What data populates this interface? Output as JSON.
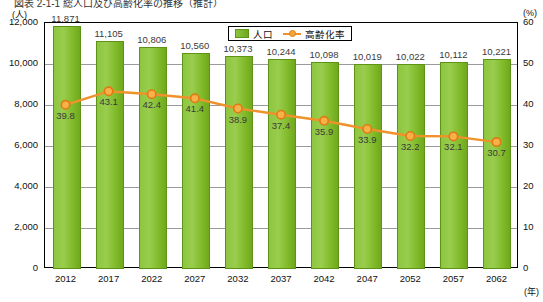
{
  "top_title": "図表 2-1-1 総人口及び高齢化率の推移（推計）",
  "legend": {
    "position": "top-center",
    "items": [
      {
        "name": "population-legend",
        "label": "人口",
        "color": "#8cc63f",
        "type": "bar"
      },
      {
        "name": "aging-rate-legend",
        "label": "高齢化率",
        "color": "#f0922b",
        "type": "line"
      }
    ]
  },
  "axes": {
    "y_left_unit": "(人)",
    "y_right_unit": "(%)",
    "x_unit": "(年)",
    "y_left_ticks": [
      "0",
      "2,000",
      "4,000",
      "6,000",
      "8,000",
      "10,000",
      "12,000"
    ],
    "y_right_ticks": [
      "0",
      "10",
      "20",
      "30",
      "40",
      "50",
      "60"
    ]
  },
  "chart_data": {
    "type": "bar",
    "title": "図表 2-1-1 総人口及び高齢化率の推移（推計）",
    "xlabel": "(年)",
    "ylabel": "(人)",
    "y2label": "(%)",
    "ylim": [
      0,
      12000
    ],
    "y2lim": [
      0,
      60
    ],
    "grid": true,
    "categories": [
      "2012",
      "2017",
      "2022",
      "2027",
      "2032",
      "2037",
      "2042",
      "2047",
      "2052",
      "2057",
      "2062"
    ],
    "series": [
      {
        "name": "人口",
        "type": "bar",
        "axis": "left",
        "color": "#8cc63f",
        "values": [
          11871,
          11105,
          10806,
          10560,
          10373,
          10244,
          10098,
          10019,
          10022,
          10112,
          10221
        ],
        "labels": [
          "11,871",
          "11,105",
          "10,806",
          "10,560",
          "10,373",
          "10,244",
          "10,098",
          "10,019",
          "10,022",
          "10,112",
          "10,221"
        ]
      },
      {
        "name": "高齢化率",
        "type": "line",
        "axis": "right",
        "color": "#f0922b",
        "values": [
          39.8,
          43.1,
          42.4,
          41.4,
          38.9,
          37.4,
          35.9,
          33.9,
          32.2,
          32.1,
          30.7
        ],
        "labels": [
          "39.8",
          "43.1",
          "42.4",
          "41.4",
          "38.9",
          "37.4",
          "35.9",
          "33.9",
          "32.2",
          "32.1",
          "30.7"
        ]
      }
    ]
  }
}
